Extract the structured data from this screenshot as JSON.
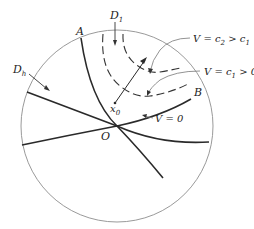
{
  "diagram": {
    "type": "stability-region-diagram",
    "labels": {
      "A": "A",
      "B": "B",
      "O": "O",
      "D1": "D",
      "D1_sub": "1",
      "Dh": "D",
      "Dh_sub": "h",
      "x0": "x",
      "x0_sub": "0",
      "V_c2_pre": "V = c",
      "V_c2_sub": "2",
      "V_c2_mid": " > c",
      "V_c2_sub2": "1",
      "V_c1_pre": "V = c",
      "V_c1_sub": "1",
      "V_c1_post": " > 0",
      "V0": "V = 0"
    },
    "colors": {
      "circle": "#9a9a9a",
      "curve": "#2a2a2a",
      "dashed": "#333333",
      "text": "#222222"
    }
  }
}
